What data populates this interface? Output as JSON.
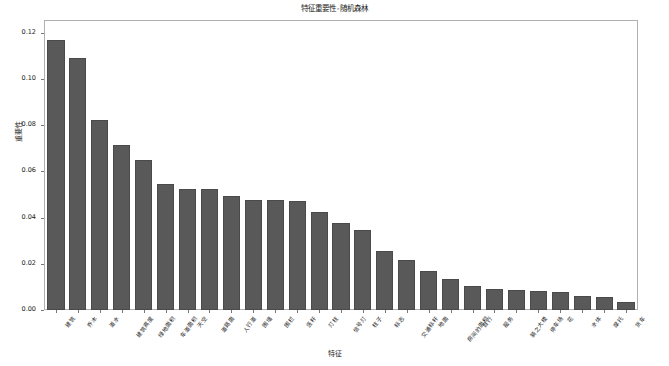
{
  "chart_data": {
    "type": "bar",
    "title": "特征重要性-随机森林",
    "xlabel": "特征",
    "ylabel": "重要性",
    "ylim": [
      0.0,
      0.125
    ],
    "yticks": [
      "0.00",
      "0.02",
      "0.04",
      "0.06",
      "0.08",
      "0.10",
      "0.12"
    ],
    "ytick_values": [
      0.0,
      0.02,
      0.04,
      0.06,
      0.08,
      0.1,
      0.12
    ],
    "grid": false,
    "legend": "none",
    "bar_color": "#595959",
    "bar_edge_color": "#4a4a4a",
    "categories": [
      "建筑",
      "乔木",
      "道水",
      "建筑高度",
      "绿地面积",
      "车道面积",
      "天空",
      "道路面",
      "人行道",
      "围墙",
      "围栏",
      "竖杆",
      "灯柱",
      "信号灯",
      "柱子",
      "标志",
      "交通标杆",
      "地面",
      "房间的面积",
      "自行",
      "服务",
      "骑之大楼",
      "停车场",
      "花",
      "水体",
      "摩托",
      "货车"
    ],
    "values": [
      0.117,
      0.109,
      0.082,
      0.0715,
      0.065,
      0.0545,
      0.0525,
      0.0522,
      0.0492,
      0.0475,
      0.0475,
      0.0472,
      0.0425,
      0.0375,
      0.0345,
      0.0255,
      0.0218,
      0.0168,
      0.0135,
      0.0105,
      0.0093,
      0.0086,
      0.0084,
      0.008,
      0.0062,
      0.0057,
      0.0033
    ]
  }
}
